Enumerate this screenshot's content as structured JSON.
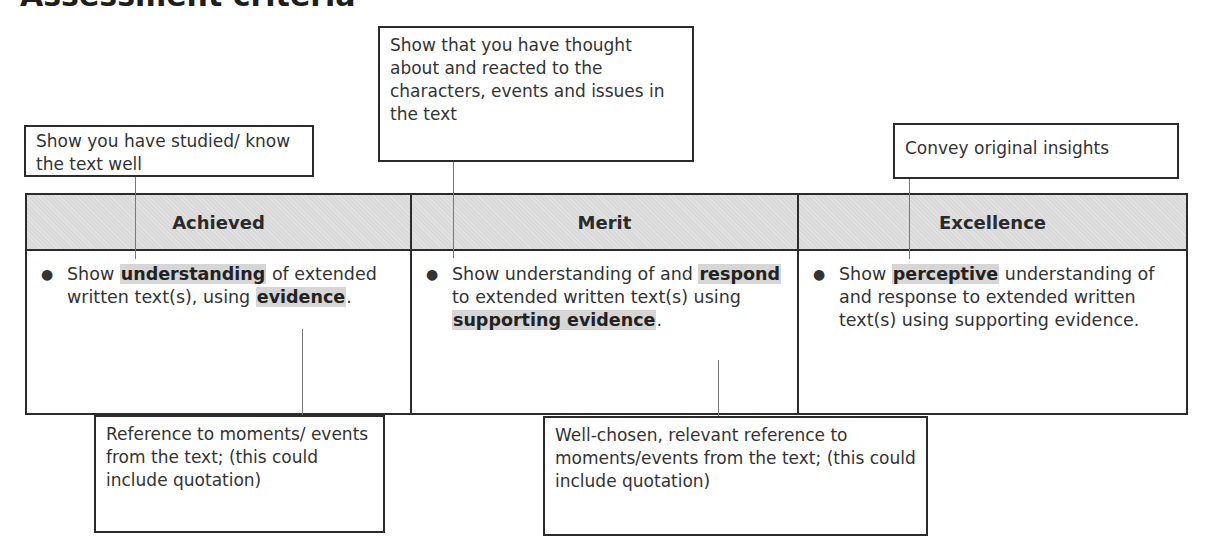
{
  "page": {
    "title": "Assessment criteria"
  },
  "callouts_top": [
    {
      "text": "Show you have studied/ know the text well"
    },
    {
      "text": "Show that you have thought about and reacted to the characters, events and issues in the text"
    },
    {
      "text": "Convey original insights"
    }
  ],
  "table": {
    "headers": [
      "Achieved",
      "Merit",
      "Excellence"
    ],
    "cells": [
      {
        "parts": [
          {
            "t": "Show ",
            "h": false
          },
          {
            "t": "understanding",
            "h": true
          },
          {
            "t": " of extended written text(s), using ",
            "h": false
          },
          {
            "t": "evidence",
            "h": true
          },
          {
            "t": ".",
            "h": false
          }
        ]
      },
      {
        "parts": [
          {
            "t": "Show understanding of and ",
            "h": false
          },
          {
            "t": "respond",
            "h": true
          },
          {
            "t": " to extended written text(s) using ",
            "h": false
          },
          {
            "t": "supporting evidence",
            "h": true
          },
          {
            "t": ".",
            "h": false
          }
        ]
      },
      {
        "parts": [
          {
            "t": "Show ",
            "h": false
          },
          {
            "t": "perceptive",
            "h": true
          },
          {
            "t": " understanding of and response to extended written text(s) using supporting evidence.",
            "h": false
          }
        ]
      }
    ]
  },
  "callouts_bottom": [
    {
      "text": "Reference to moments/ events from the text; (this could include quotation)"
    },
    {
      "text": "Well-chosen, relevant reference to moments/events from the text; (this could include quotation)"
    }
  ],
  "colors": {
    "header_bg": "#d9d9d9",
    "highlight_bg": "#d6d6d6",
    "border": "#2b2b2b"
  }
}
